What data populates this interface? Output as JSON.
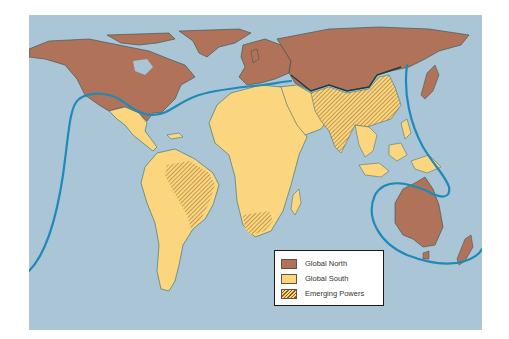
{
  "map": {
    "title": "",
    "colors": {
      "ocean": "#a9c5d6",
      "global_north": "#b0735a",
      "global_south": "#fcd67e",
      "emerging_hatch": "#8a5a2a",
      "divide_line": "#1f8ab8",
      "coast": "#2e6b6b"
    },
    "regions": [
      {
        "name": "North America",
        "category": "Global North"
      },
      {
        "name": "Europe",
        "category": "Global North"
      },
      {
        "name": "Russia",
        "category": "Global North"
      },
      {
        "name": "Japan",
        "category": "Global North"
      },
      {
        "name": "Australia",
        "category": "Global North"
      },
      {
        "name": "New Zealand",
        "category": "Global North"
      },
      {
        "name": "Central America",
        "category": "Global South"
      },
      {
        "name": "South America",
        "category": "Global South"
      },
      {
        "name": "Africa",
        "category": "Global South"
      },
      {
        "name": "Middle East",
        "category": "Global South"
      },
      {
        "name": "Southeast Asia",
        "category": "Global South"
      },
      {
        "name": "Brazil",
        "category": "Emerging Powers"
      },
      {
        "name": "China",
        "category": "Emerging Powers"
      },
      {
        "name": "India",
        "category": "Emerging Powers"
      },
      {
        "name": "South Africa",
        "category": "Emerging Powers"
      }
    ]
  },
  "legend": {
    "items": [
      {
        "label": "Global North",
        "color": "#b0735a",
        "pattern": "solid"
      },
      {
        "label": "Global South",
        "color": "#fcd67e",
        "pattern": "solid"
      },
      {
        "label": "Emerging Powers",
        "color": "#fcd67e",
        "pattern": "hatched"
      }
    ]
  }
}
